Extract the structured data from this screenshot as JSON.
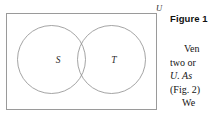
{
  "figure": {
    "universe_label": "U",
    "set_left_label": "S",
    "set_right_label": "T",
    "caption": "Figure 1",
    "stroke_color": "#8d8d8d",
    "rect_color": "#9a9a9a",
    "background": "#ffffff"
  },
  "body_text": {
    "lines": [
      "Ven",
      "two or",
      "U. As",
      "(Fig. 2)",
      "We"
    ]
  }
}
